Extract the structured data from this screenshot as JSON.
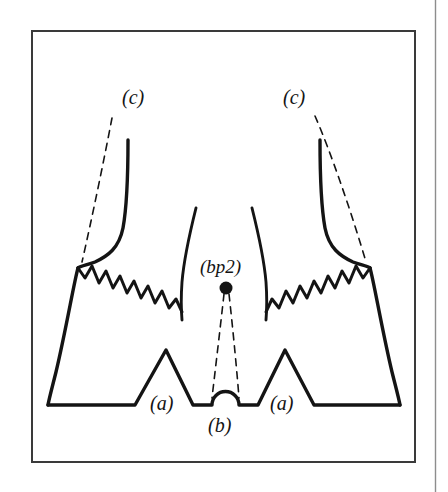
{
  "figure": {
    "background_color": "#ffffff",
    "ink_color": "#141414",
    "frame": {
      "page_edge_color": "#8d8d8d",
      "inner_border_color": "#3a3a3a",
      "inner_border_x": 32,
      "inner_border_y": 31,
      "inner_border_width": 383,
      "inner_border_height": 431,
      "page_rule_x": 435
    },
    "labels": [
      {
        "id": "c-left",
        "text": "(c)",
        "x": 122,
        "y": 104
      },
      {
        "id": "c-right",
        "text": "(c)",
        "x": 283,
        "y": 104
      },
      {
        "id": "bp2",
        "text": "(bp2)",
        "x": 200,
        "y": 273
      },
      {
        "id": "a-left",
        "text": "(a)",
        "x": 150,
        "y": 410
      },
      {
        "id": "a-right",
        "text": "(a)",
        "x": 270,
        "y": 410
      },
      {
        "id": "b",
        "text": "(b)",
        "x": 208,
        "y": 432
      }
    ],
    "marker": {
      "name": "bp2-point",
      "cx": 226,
      "cy": 288,
      "r": 6.5
    },
    "strokes": {
      "outline_width": 3.4,
      "inner_curve_width": 2.8,
      "zigzag_width": 3.0,
      "dashed_width": 1.6,
      "dash_pattern": "7 6"
    },
    "legend_note": "(a) notches, (b) central bump, (c) upper margins, (bp2) marked point"
  }
}
